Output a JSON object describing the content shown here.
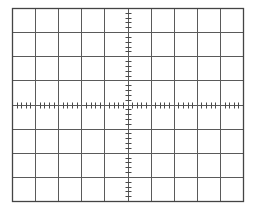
{
  "graticule": {
    "type": "oscilloscope-graticule",
    "divisions_x": 10,
    "divisions_y": 8,
    "minor_ticks_per_division": 5,
    "bounds": {
      "left": 12,
      "top": 8,
      "right": 243,
      "bottom": 201
    },
    "colors": {
      "background": "#ffffff",
      "grid_line": "#5a5a5a",
      "border": "#444444",
      "tick": "#4a4a4a"
    }
  }
}
